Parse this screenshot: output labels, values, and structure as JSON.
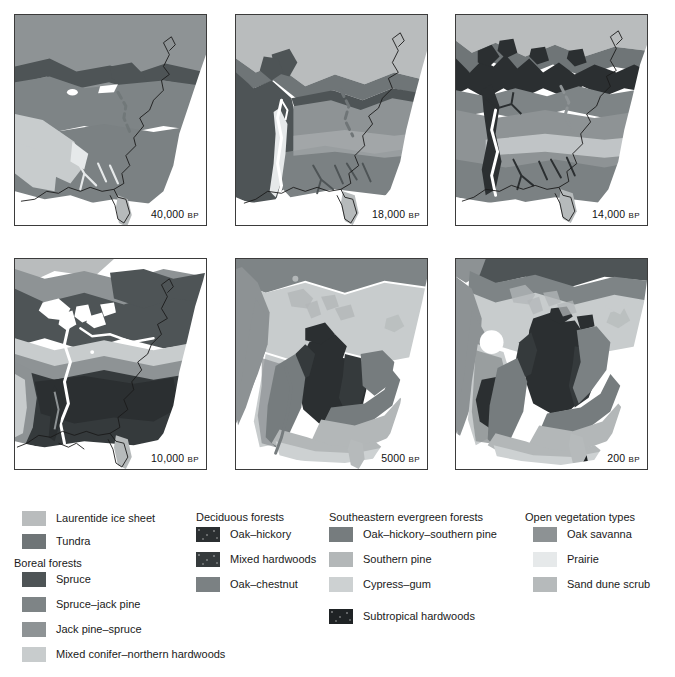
{
  "figure": {
    "kind": "vegetation-history-map-series",
    "region": "Eastern North America",
    "panel_count": 6
  },
  "panels": [
    {
      "id": "p40000",
      "age": "40,000",
      "age_suffix": "BP",
      "label": "40,000 BP",
      "row": 0,
      "col": 0
    },
    {
      "id": "p18000",
      "age": "18,000",
      "age_suffix": "BP",
      "label": "18,000 BP",
      "row": 0,
      "col": 1
    },
    {
      "id": "p14000",
      "age": "14,000",
      "age_suffix": "BP",
      "label": "14,000 BP",
      "row": 0,
      "col": 2
    },
    {
      "id": "p10000",
      "age": "10,000",
      "age_suffix": "BP",
      "label": "10,000 BP",
      "row": 1,
      "col": 0
    },
    {
      "id": "p5000",
      "age": "5000",
      "age_suffix": "BP",
      "label": "5000 BP",
      "row": 1,
      "col": 1
    },
    {
      "id": "p200",
      "age": "200",
      "age_suffix": "BP",
      "label": "200 BP",
      "row": 1,
      "col": 2
    }
  ],
  "legend": {
    "columns": [
      {
        "id": "col-1",
        "groups": [
          {
            "heading": null,
            "items": [
              {
                "label": "Laurentide ice sheet",
                "color": "#b9bcbd",
                "textured": false
              },
              {
                "label": "Tundra",
                "color": "#6f7577",
                "textured": false
              }
            ]
          },
          {
            "heading": "Boreal forests",
            "items": [
              {
                "label": "Spruce",
                "color": "#4e5456",
                "textured": false
              },
              {
                "label": "Spruce–jack pine",
                "color": "#7e8486",
                "textured": false
              },
              {
                "label": "Jack pine–spruce",
                "color": "#8e9395",
                "textured": false
              },
              {
                "label": "Mixed conifer–northern hardwoods",
                "color": "#c8cccd",
                "textured": false
              }
            ]
          }
        ]
      },
      {
        "id": "col-2",
        "groups": [
          {
            "heading": "Deciduous forests",
            "items": [
              {
                "label": "Oak–hickory",
                "color": "#2b2f31",
                "textured": true
              },
              {
                "label": "Mixed hardwoods",
                "color": "#353a3c",
                "textured": true
              },
              {
                "label": "Oak–chestnut",
                "color": "#7b8183",
                "textured": false
              }
            ]
          }
        ]
      },
      {
        "id": "col-3",
        "groups": [
          {
            "heading": "Southeastern evergreen forests",
            "items": [
              {
                "label": "Oak–hickory–southern pine",
                "color": "#767c7e",
                "textured": false
              },
              {
                "label": "Southern pine",
                "color": "#b3b7b8",
                "textured": false
              },
              {
                "label": "Cypress–gum",
                "color": "#cdd1d2",
                "textured": false
              },
              {
                "label": "Subtropical hardwoods",
                "color": "#1f2325",
                "textured": true
              }
            ]
          }
        ]
      },
      {
        "id": "col-4",
        "groups": [
          {
            "heading": "Open vegetation types",
            "items": [
              {
                "label": "Oak savanna",
                "color": "#8d9294",
                "textured": false
              },
              {
                "label": "Prairie",
                "color": "#e6e9ea",
                "textured": false
              },
              {
                "label": "Sand dune scrub",
                "color": "#b6babb",
                "textured": false
              }
            ]
          }
        ]
      }
    ]
  },
  "colors": {
    "ice_sheet": "#b9bcbd",
    "tundra": "#6f7577",
    "spruce": "#4e5456",
    "spruce_jack_pine": "#7e8486",
    "jack_pine_spruce": "#8e9395",
    "mixed_conifer_northern_hardwoods": "#c8cccd",
    "oak_hickory": "#2b2f31",
    "mixed_hardwoods": "#353a3c",
    "oak_chestnut": "#7b8183",
    "oak_hickory_southern_pine": "#767c7e",
    "southern_pine": "#b3b7b8",
    "cypress_gum": "#cdd1d2",
    "subtropical_hardwoods": "#1f2325",
    "oak_savanna": "#8d9294",
    "prairie": "#e6e9ea",
    "sand_dune_scrub": "#b6babb",
    "ocean": "#ffffff",
    "coastline": "#1a1a1a",
    "panel_border": "#3b3b3b",
    "text": "#1a1a1a"
  }
}
